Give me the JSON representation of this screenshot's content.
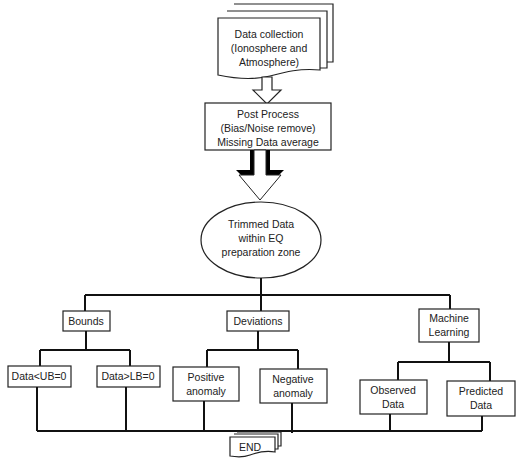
{
  "diagram": {
    "type": "flowchart",
    "nodes": {
      "data_collection": {
        "lines": [
          "Data collection",
          "(Ionosphere and",
          "Atmosphere)"
        ],
        "shape": "multi-document"
      },
      "post_process": {
        "lines": [
          "Post Process",
          "(Bias/Noise remove)",
          "Missing Data average"
        ],
        "shape": "rectangle"
      },
      "trimmed_data": {
        "lines": [
          "Trimmed Data",
          "within EQ",
          "preparation zone"
        ],
        "shape": "ellipse"
      },
      "bounds": {
        "lines": [
          "Bounds"
        ],
        "shape": "rectangle"
      },
      "deviations": {
        "lines": [
          "Deviations"
        ],
        "shape": "rectangle"
      },
      "machine_learning": {
        "lines": [
          "Machine",
          "Learning"
        ],
        "shape": "rectangle"
      },
      "data_ub": {
        "lines": [
          "Data<UB=0"
        ],
        "shape": "rectangle"
      },
      "data_lb": {
        "lines": [
          "Data>LB=0"
        ],
        "shape": "rectangle"
      },
      "positive_anomaly": {
        "lines": [
          "Positive",
          "anomaly"
        ],
        "shape": "rectangle"
      },
      "negative_anomaly": {
        "lines": [
          "Negative",
          "anomaly"
        ],
        "shape": "rectangle"
      },
      "observed_data": {
        "lines": [
          "Observed",
          "Data"
        ],
        "shape": "rectangle"
      },
      "predicted_data": {
        "lines": [
          "Predicted",
          "Data"
        ],
        "shape": "rectangle"
      },
      "end": {
        "lines": [
          "END"
        ],
        "shape": "multi-document"
      }
    },
    "edges": [
      [
        "data_collection",
        "post_process"
      ],
      [
        "post_process",
        "trimmed_data"
      ],
      [
        "trimmed_data",
        "bounds"
      ],
      [
        "trimmed_data",
        "deviations"
      ],
      [
        "trimmed_data",
        "machine_learning"
      ],
      [
        "bounds",
        "data_ub"
      ],
      [
        "bounds",
        "data_lb"
      ],
      [
        "deviations",
        "positive_anomaly"
      ],
      [
        "deviations",
        "negative_anomaly"
      ],
      [
        "machine_learning",
        "observed_data"
      ],
      [
        "machine_learning",
        "predicted_data"
      ],
      [
        "data_ub",
        "end"
      ],
      [
        "data_lb",
        "end"
      ],
      [
        "positive_anomaly",
        "end"
      ],
      [
        "negative_anomaly",
        "end"
      ],
      [
        "observed_data",
        "end"
      ],
      [
        "predicted_data",
        "end"
      ]
    ]
  }
}
